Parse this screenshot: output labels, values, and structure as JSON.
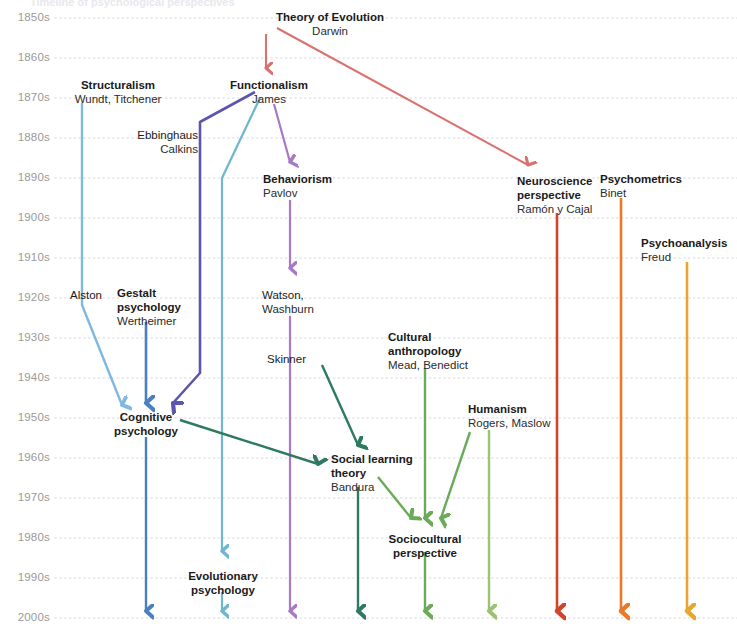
{
  "diagram": {
    "title_clipped": "Timeline of psychological perspectives",
    "type": "timeline-flow",
    "axis": {
      "label_name": "decades",
      "decades": [
        "1850s",
        "1860s",
        "1870s",
        "1880s",
        "1890s",
        "1900s",
        "1910s",
        "1920s",
        "1930s",
        "1940s",
        "1950s",
        "1960s",
        "1970s",
        "1980s",
        "1990s",
        "2000s"
      ],
      "gridline_style": "dotted",
      "gridline_color": "#d9d9e3",
      "decade_y": [
        18,
        58,
        98,
        138,
        178,
        218,
        258,
        298,
        338,
        378,
        418,
        458,
        498,
        538,
        578,
        618
      ]
    },
    "colors": {
      "salmon": "#d9726f",
      "light_blue": "#7fb8e0",
      "steel_blue": "#4a7fc1",
      "indigo": "#5b56ab",
      "cyan_blue": "#6fb6cf",
      "purple": "#a879c4",
      "dark_green": "#2e7a5e",
      "mid_green": "#6aab5a",
      "light_green": "#9cc273",
      "red_orange": "#d1452a",
      "orange": "#ea7a2a",
      "amber": "#e9a62c",
      "text": "#1a1a1a",
      "axis_text": "#9a9a9a"
    },
    "nodes": [
      {
        "id": "theory-of-evolution",
        "title": "Theory of Evolution",
        "subtitle": "Darwin",
        "x": 330,
        "y": 10,
        "align": "center",
        "bold": true
      },
      {
        "id": "structuralism",
        "title": "Structuralism",
        "subtitle": "Wundt, Titchener",
        "x": 118,
        "y": 78,
        "align": "center",
        "bold": true
      },
      {
        "id": "functionalism",
        "title": "Functionalism",
        "subtitle": "James",
        "x": 269,
        "y": 78,
        "align": "center",
        "bold": true
      },
      {
        "id": "ebbinghaus-calkins",
        "title": "Ebbinghaus",
        "subtitle": "Calkins",
        "x": 198,
        "y": 128,
        "align": "right",
        "bold": false
      },
      {
        "id": "behaviorism",
        "title": "Behaviorism",
        "subtitle": "Pavlov",
        "x": 263,
        "y": 172,
        "align": "left",
        "bold": true
      },
      {
        "id": "neuroscience-perspective",
        "title": "Neuroscience\nperspective",
        "subtitle": "Ramón y Cajal",
        "x": 517,
        "y": 174,
        "align": "left",
        "bold": true
      },
      {
        "id": "psychometrics",
        "title": "Psychometrics",
        "subtitle": "Binet",
        "x": 600,
        "y": 172,
        "align": "left",
        "bold": true
      },
      {
        "id": "psychoanalysis",
        "title": "Psychoanalysis",
        "subtitle": "Freud",
        "x": 641,
        "y": 236,
        "align": "left",
        "bold": true
      },
      {
        "id": "alston",
        "title": "Alston",
        "subtitle": "",
        "x": 70,
        "y": 288,
        "align": "left",
        "bold": false
      },
      {
        "id": "gestalt-psychology",
        "title": "Gestalt\npsychology",
        "subtitle": "Wertheimer",
        "x": 117,
        "y": 286,
        "align": "left",
        "bold": true
      },
      {
        "id": "watson-washburn",
        "title": "Watson,",
        "subtitle": "Washburn",
        "x": 262,
        "y": 288,
        "align": "left",
        "bold": false
      },
      {
        "id": "cultural-anthropology",
        "title": "Cultural\nanthropology",
        "subtitle": "Mead, Benedict",
        "x": 388,
        "y": 330,
        "align": "left",
        "bold": true
      },
      {
        "id": "skinner",
        "title": "Skinner",
        "subtitle": "",
        "x": 267,
        "y": 352,
        "align": "left",
        "bold": false
      },
      {
        "id": "cognitive-psychology",
        "title": "Cognitive\npsychology",
        "subtitle": "",
        "x": 146,
        "y": 410,
        "align": "center",
        "bold": true
      },
      {
        "id": "humanism",
        "title": "Humanism",
        "subtitle": "Rogers, Maslow",
        "x": 468,
        "y": 402,
        "align": "left",
        "bold": true
      },
      {
        "id": "social-learning-theory",
        "title": "Social learning\ntheory",
        "subtitle": "Bandura",
        "x": 331,
        "y": 452,
        "align": "left",
        "bold": true
      },
      {
        "id": "sociocultural-perspective",
        "title": "Sociocultural\nperspective",
        "subtitle": "",
        "x": 425,
        "y": 532,
        "align": "center",
        "bold": true
      },
      {
        "id": "evolutionary-psychology",
        "title": "Evolutionary\npsychology",
        "subtitle": "",
        "x": 223,
        "y": 569,
        "align": "center",
        "bold": true
      }
    ],
    "flows": [
      {
        "id": "darwin-to-functionalism",
        "color": "#d9726f",
        "from": "theory-of-evolution",
        "to": "functionalism",
        "arrow": true
      },
      {
        "id": "darwin-to-neuroscience",
        "color": "#d9726f",
        "from": "theory-of-evolution",
        "to": "neuroscience-perspective",
        "arrow": true
      },
      {
        "id": "structuralism-trunk",
        "color": "#7fb8e0",
        "from": "structuralism",
        "to": "cognitive-psychology",
        "arrow": true
      },
      {
        "id": "gestalt-trunk",
        "color": "#4a7fc1",
        "from": "gestalt-psychology",
        "to": "cognitive-psychology",
        "arrow": true
      },
      {
        "id": "ebbinghaus-trunk",
        "color": "#5b56ab",
        "from": "ebbinghaus-calkins",
        "to": "cognitive-psychology",
        "arrow": true
      },
      {
        "id": "functionalism-to-evolutionary",
        "color": "#6fb6cf",
        "from": "functionalism",
        "to": "evolutionary-psychology",
        "arrow": true
      },
      {
        "id": "functionalism-to-behaviorism",
        "color": "#a879c4",
        "from": "functionalism",
        "to": "behaviorism",
        "arrow": true
      },
      {
        "id": "behaviorism-trunk",
        "color": "#a879c4",
        "from": "behaviorism",
        "to": "2000s",
        "arrow": true
      },
      {
        "id": "cognitive-trunk",
        "color": "#4a7fc1",
        "from": "cognitive-psychology",
        "to": "2000s",
        "arrow": true
      },
      {
        "id": "evolutionary-trunk",
        "color": "#6fb6cf",
        "from": "evolutionary-psychology",
        "to": "2000s",
        "arrow": true
      },
      {
        "id": "skinner-to-social-learning",
        "color": "#2e7a5e",
        "from": "skinner",
        "to": "social-learning-theory",
        "arrow": true
      },
      {
        "id": "cognitive-to-social-learning",
        "color": "#2e7a5e",
        "from": "cognitive-psychology",
        "to": "social-learning-theory",
        "arrow": true
      },
      {
        "id": "social-learning-trunk",
        "color": "#2e7a5e",
        "from": "social-learning-theory",
        "to": "2000s",
        "arrow": true
      },
      {
        "id": "social-learning-to-sociocultural",
        "color": "#6aab5a",
        "from": "social-learning-theory",
        "to": "sociocultural-perspective",
        "arrow": true
      },
      {
        "id": "cultural-anthropology-to-sociocultural",
        "color": "#6aab5a",
        "from": "cultural-anthropology",
        "to": "sociocultural-perspective",
        "arrow": true
      },
      {
        "id": "humanism-to-sociocultural",
        "color": "#6aab5a",
        "from": "humanism",
        "to": "sociocultural-perspective",
        "arrow": true
      },
      {
        "id": "sociocultural-trunk",
        "color": "#6aab5a",
        "from": "sociocultural-perspective",
        "to": "2000s",
        "arrow": true
      },
      {
        "id": "humanism-trunk",
        "color": "#9cc273",
        "from": "humanism",
        "to": "2000s",
        "arrow": true
      },
      {
        "id": "neuroscience-trunk",
        "color": "#d1452a",
        "from": "neuroscience-perspective",
        "to": "2000s",
        "arrow": true
      },
      {
        "id": "psychometrics-trunk",
        "color": "#ea7a2a",
        "from": "psychometrics",
        "to": "2000s",
        "arrow": true
      },
      {
        "id": "psychoanalysis-trunk",
        "color": "#e9a62c",
        "from": "psychoanalysis",
        "to": "2000s",
        "arrow": true
      }
    ]
  }
}
